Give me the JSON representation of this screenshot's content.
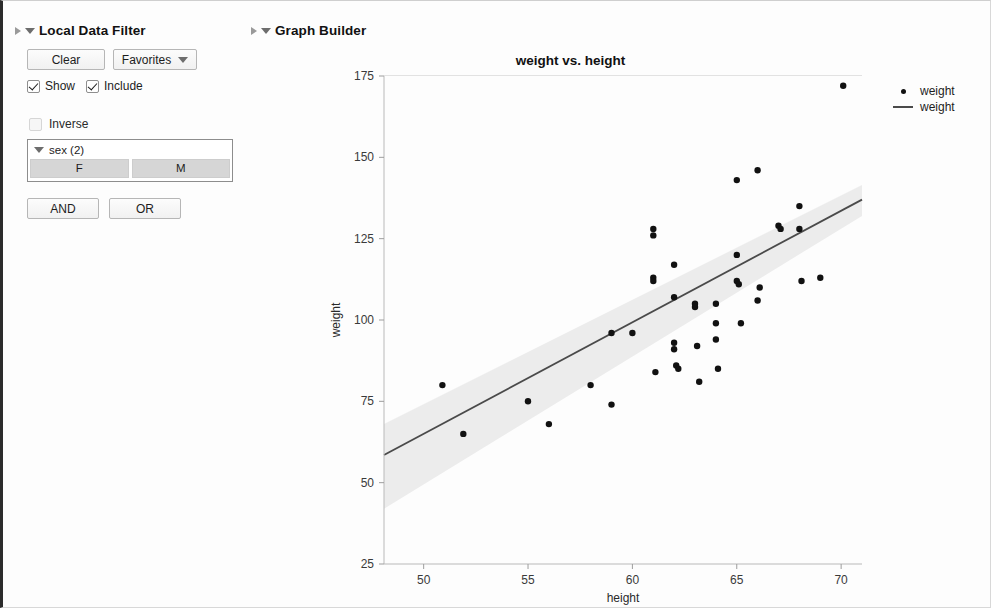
{
  "filter_panel": {
    "title": "Local Data Filter",
    "disclosure_icon": "triangle-collapse-icon",
    "menu_icon": "red-triangle-menu-icon",
    "clear_label": "Clear",
    "favorites_label": "Favorites",
    "favorites_caret_icon": "chevron-down-icon",
    "show_label": "Show",
    "show_checked": true,
    "include_label": "Include",
    "include_checked": true,
    "inverse_label": "Inverse",
    "inverse_checked": false,
    "column": {
      "name": "sex (2)",
      "caret_icon": "chevron-down-icon",
      "values": [
        "F",
        "M"
      ]
    },
    "and_label": "AND",
    "or_label": "OR"
  },
  "graph_panel": {
    "title": "Graph Builder",
    "disclosure_icon": "triangle-collapse-icon",
    "menu_icon": "red-triangle-menu-icon"
  },
  "chart_data": {
    "type": "scatter",
    "title": "weight vs. height",
    "xlabel": "height",
    "ylabel": "weight",
    "xlim": [
      48.1,
      71.0
    ],
    "ylim": [
      25,
      175
    ],
    "xticks": [
      50,
      55,
      60,
      65,
      70
    ],
    "yticks": [
      25,
      50,
      75,
      100,
      125,
      150,
      175
    ],
    "grid": false,
    "legend_position": "right",
    "legend": [
      {
        "label": "weight",
        "marker": "dot",
        "color": "#111111"
      },
      {
        "label": "weight",
        "marker": "line",
        "color": "#4a4a4a"
      }
    ],
    "series": [
      {
        "name": "weight",
        "type": "scatter",
        "marker_color": "#111111",
        "x": [
          50.9,
          51.9,
          55.0,
          56.0,
          58.0,
          59.0,
          59.0,
          60.0,
          61.0,
          61.0,
          61.0,
          61.0,
          61.1,
          62.0,
          62.0,
          62.0,
          62.0,
          62.1,
          62.2,
          63.0,
          63.0,
          63.1,
          63.2,
          64.0,
          64.0,
          64.0,
          64.1,
          65.0,
          65.0,
          65.0,
          65.1,
          65.2,
          66.0,
          66.0,
          66.1,
          67.0,
          67.1,
          68.0,
          68.0,
          68.1,
          69.0,
          70.1
        ],
        "y": [
          80,
          65,
          75,
          68,
          80,
          96,
          74,
          96,
          128,
          126,
          113,
          112,
          84,
          117,
          107,
          93,
          91,
          86,
          85,
          105,
          104,
          92,
          81,
          105,
          99,
          94,
          85,
          143,
          120,
          112,
          111,
          99,
          146,
          106,
          110,
          129,
          128,
          135,
          128,
          112,
          113,
          172
        ]
      },
      {
        "name": "weight",
        "type": "line",
        "description": "linear fit with confidence band",
        "line_color": "#4a4a4a",
        "band_color": "#ececec",
        "fit_x": [
          48.1,
          71.0
        ],
        "fit_y": [
          58.5,
          137.0
        ],
        "band_upper": [
          68.0,
          141.5
        ],
        "band_lower": [
          42.0,
          132.0
        ]
      }
    ]
  }
}
